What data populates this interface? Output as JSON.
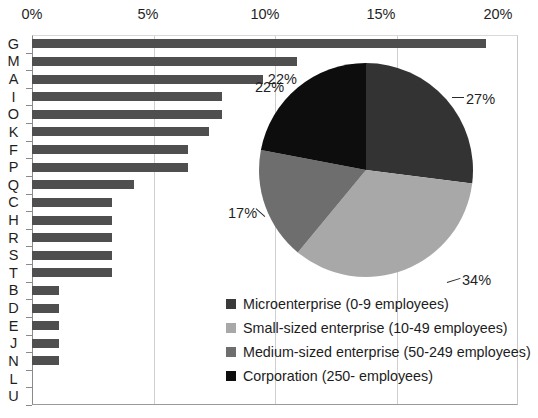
{
  "chart_data": [
    {
      "type": "bar",
      "orientation": "horizontal",
      "title": "",
      "xlabel": "",
      "ylabel": "",
      "xlim": [
        0,
        20
      ],
      "xticks": [
        "0%",
        "5%",
        "10%",
        "15%",
        "20%"
      ],
      "xtick_values": [
        0,
        5,
        10,
        15,
        20
      ],
      "grid": true,
      "bar_color": "#4f4f4f",
      "categories": [
        "G",
        "M",
        "A",
        "I",
        "O",
        "K",
        "F",
        "P",
        "Q",
        "C",
        "H",
        "R",
        "S",
        "T",
        "B",
        "D",
        "E",
        "J",
        "N",
        "L",
        "U"
      ],
      "values": [
        18.7,
        10.9,
        9.5,
        7.8,
        7.8,
        7.3,
        6.4,
        6.4,
        4.2,
        3.3,
        3.3,
        3.3,
        3.3,
        3.3,
        1.1,
        1.1,
        1.1,
        1.1,
        1.1,
        0,
        0
      ],
      "data_labels": [
        {
          "category": "A",
          "text": "22%"
        }
      ]
    },
    {
      "type": "pie",
      "title": "",
      "start_angle_deg": 0,
      "direction": "clockwise",
      "labels": [
        "Microenterprise (0-9 employees)",
        "Small-sized enterprise (10-49 employees)",
        "Medium-sized enterprise (50-249 employees)",
        "Corporation (250-  employees)"
      ],
      "values": [
        27,
        34,
        17,
        22
      ],
      "value_labels": [
        "27%",
        "34%",
        "17%",
        "22%"
      ],
      "colors": [
        "#333333",
        "#a8a8a8",
        "#6e6e6e",
        "#0d0d0d"
      ],
      "legend_position": "bottom-left"
    }
  ],
  "xaxis": {
    "ticks": [
      {
        "label": "0%",
        "x": 32
      },
      {
        "label": "5%",
        "x": 148
      },
      {
        "label": "10%",
        "x": 265
      },
      {
        "label": "15%",
        "x": 381
      },
      {
        "label": "20%",
        "x": 498
      }
    ]
  },
  "legend": {
    "items": [
      {
        "label": "Microenterprise (0-9 employees)",
        "color": "#3a3a3a"
      },
      {
        "label": "Small-sized enterprise (10-49 employees)",
        "color": "#a8a8a8"
      },
      {
        "label": "Medium-sized enterprise (50-249 employees)",
        "color": "#6e6e6e"
      },
      {
        "label": "Corporation (250-  employees)",
        "color": "#0d0d0d"
      }
    ]
  },
  "pie_callouts": [
    {
      "text": "27%",
      "left": 466,
      "top": 91
    },
    {
      "text": "34%",
      "left": 462,
      "top": 272
    },
    {
      "text": "17%",
      "left": 228,
      "top": 205
    },
    {
      "text": "22%",
      "left": 255,
      "top": 79
    }
  ]
}
